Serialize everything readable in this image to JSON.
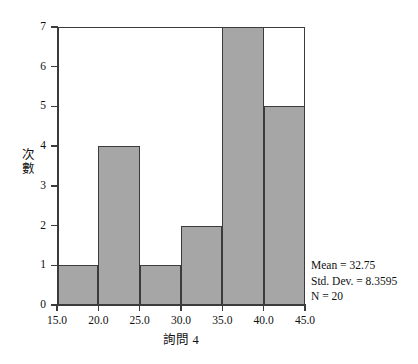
{
  "chart_data": {
    "type": "bar",
    "title": "",
    "xlabel": "詢問 4",
    "ylabel": "次數",
    "ylabel_chars": [
      "次",
      "數"
    ],
    "categories": [
      "15.0-20.0",
      "20.0-25.0",
      "25.0-30.0",
      "30.0-35.0",
      "35.0-40.0",
      "40.0-45.0"
    ],
    "bin_edges": [
      15.0,
      20.0,
      25.0,
      30.0,
      35.0,
      40.0,
      45.0
    ],
    "values": [
      1,
      4,
      1,
      2,
      7,
      5
    ],
    "bin_width": 5.0,
    "xlim": [
      15.0,
      45.0
    ],
    "ylim": [
      0,
      7
    ],
    "x_ticks": [
      "15.0",
      "20.0",
      "25.0",
      "30.0",
      "35.0",
      "40.0",
      "45.0"
    ],
    "y_ticks": [
      "0",
      "1",
      "2",
      "3",
      "4",
      "5",
      "6",
      "7"
    ],
    "grid": false,
    "legend": false,
    "bar_color": "#a6a6a6",
    "bar_edge_color": "#3b3b3b",
    "background_color": "#ffffff"
  },
  "statistics": {
    "mean_label": "Mean = 32.75",
    "std_dev_label": "Std. Dev. = 8.3595",
    "n_label": "N = 20",
    "mean": 32.75,
    "std_dev": 8.3595,
    "n": 20
  }
}
